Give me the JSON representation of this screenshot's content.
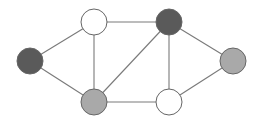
{
  "diagram": {
    "type": "undirected-graph",
    "colors": {
      "background": "#ffffff",
      "edge": "#7a7a7a",
      "node_stroke": "#666666",
      "dark": "#5a5a5a",
      "light": "#a9a9a9",
      "white": "#ffffff"
    },
    "node_radius": 13,
    "nodes": [
      {
        "id": "left",
        "x": 30,
        "y": 61,
        "fill": "dark"
      },
      {
        "id": "top-left",
        "x": 94,
        "y": 22,
        "fill": "white"
      },
      {
        "id": "top-right",
        "x": 169,
        "y": 22,
        "fill": "dark"
      },
      {
        "id": "right",
        "x": 233,
        "y": 61,
        "fill": "light"
      },
      {
        "id": "bottom-left",
        "x": 94,
        "y": 102,
        "fill": "light"
      },
      {
        "id": "bottom-right",
        "x": 169,
        "y": 102,
        "fill": "white"
      }
    ],
    "edges": [
      [
        "left",
        "top-left"
      ],
      [
        "left",
        "bottom-left"
      ],
      [
        "top-left",
        "top-right"
      ],
      [
        "top-left",
        "bottom-left"
      ],
      [
        "top-right",
        "bottom-left"
      ],
      [
        "top-right",
        "bottom-right"
      ],
      [
        "top-right",
        "right"
      ],
      [
        "bottom-left",
        "bottom-right"
      ],
      [
        "bottom-right",
        "right"
      ]
    ]
  }
}
